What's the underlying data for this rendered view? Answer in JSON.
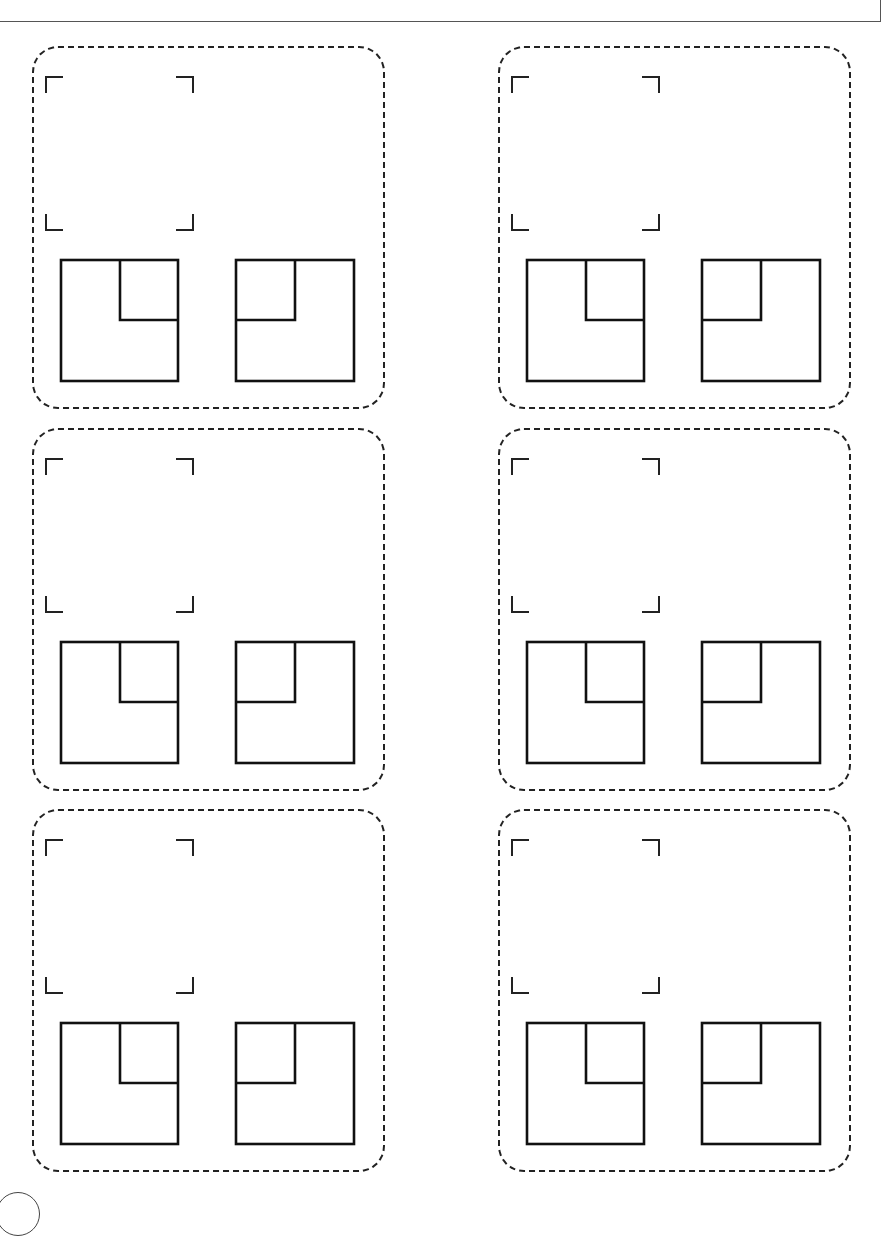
{
  "page": {
    "title": "",
    "header_box_text": ""
  },
  "worksheet": {
    "rows": 3,
    "columns": 2,
    "cards": [
      {
        "row": 1,
        "col": 1,
        "photo_frame": "empty",
        "shapes": [
          "square-with-top-right-inner-square",
          "square-with-top-left-inner-square"
        ]
      },
      {
        "row": 1,
        "col": 2,
        "photo_frame": "empty",
        "shapes": [
          "square-with-top-right-inner-square",
          "square-with-top-left-inner-square"
        ]
      },
      {
        "row": 2,
        "col": 1,
        "photo_frame": "empty",
        "shapes": [
          "square-with-top-right-inner-square",
          "square-with-top-left-inner-square"
        ]
      },
      {
        "row": 2,
        "col": 2,
        "photo_frame": "empty",
        "shapes": [
          "square-with-top-right-inner-square",
          "square-with-top-left-inner-square"
        ]
      },
      {
        "row": 3,
        "col": 1,
        "photo_frame": "empty",
        "shapes": [
          "square-with-top-right-inner-square",
          "square-with-top-left-inner-square"
        ]
      },
      {
        "row": 3,
        "col": 2,
        "photo_frame": "empty",
        "shapes": [
          "square-with-top-right-inner-square",
          "square-with-top-left-inner-square"
        ]
      }
    ]
  },
  "page_number_badge": ""
}
